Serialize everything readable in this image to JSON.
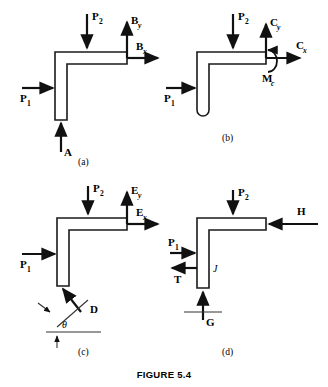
{
  "figure": {
    "caption": "FIGURE 5.4",
    "panels": [
      {
        "id": "a",
        "caption": "(a)",
        "description": "L-shaped bracket with pin reaction components at B and support force A",
        "forces": [
          {
            "name": "P1",
            "base": "P",
            "sub": "1",
            "direction": "right",
            "sub_italic": false
          },
          {
            "name": "P2",
            "base": "P",
            "sub": "2",
            "direction": "down",
            "sub_italic": false
          },
          {
            "name": "By",
            "base": "B",
            "sub": "y",
            "direction": "up",
            "sub_italic": true
          },
          {
            "name": "Bx",
            "base": "B",
            "sub": "x",
            "direction": "right",
            "sub_italic": true
          },
          {
            "name": "A",
            "base": "A",
            "sub": "",
            "direction": "up",
            "sub_italic": false
          }
        ]
      },
      {
        "id": "b",
        "caption": "(b)",
        "description": "Bracket with rounded hook end, fixed-end reactions Cx, Cy and couple Mc",
        "forces": [
          {
            "name": "P1",
            "base": "P",
            "sub": "1",
            "direction": "right",
            "sub_italic": false
          },
          {
            "name": "P2",
            "base": "P",
            "sub": "2",
            "direction": "down",
            "sub_italic": false
          },
          {
            "name": "Cy",
            "base": "C",
            "sub": "y",
            "direction": "up",
            "sub_italic": true
          },
          {
            "name": "Cx",
            "base": "C",
            "sub": "x",
            "direction": "right",
            "sub_italic": true
          },
          {
            "name": "Mc",
            "base": "M",
            "sub": "c",
            "direction": "moment",
            "sub_italic": true
          }
        ]
      },
      {
        "id": "c",
        "caption": "(c)",
        "description": "Bracket with reaction components Ex, Ey and inclined two-force member D at angle theta",
        "angle_label": "θ",
        "forces": [
          {
            "name": "P1",
            "base": "P",
            "sub": "1",
            "direction": "right",
            "sub_italic": false
          },
          {
            "name": "P2",
            "base": "P",
            "sub": "2",
            "direction": "down",
            "sub_italic": false
          },
          {
            "name": "Ey",
            "base": "E",
            "sub": "y",
            "direction": "up",
            "sub_italic": true
          },
          {
            "name": "Ex",
            "base": "E",
            "sub": "x",
            "direction": "right",
            "sub_italic": true
          },
          {
            "name": "D",
            "base": "D",
            "sub": "",
            "direction": "inclined",
            "sub_italic": false
          }
        ]
      },
      {
        "id": "d",
        "caption": "(d)",
        "description": "Bracket loaded by H, T and roller support G, member labelled J",
        "member_tag": "J",
        "forces": [
          {
            "name": "P1",
            "base": "P",
            "sub": "1",
            "direction": "right",
            "sub_italic": false
          },
          {
            "name": "P2",
            "base": "P",
            "sub": "2",
            "direction": "down",
            "sub_italic": false
          },
          {
            "name": "H",
            "base": "H",
            "sub": "",
            "direction": "left",
            "sub_italic": false
          },
          {
            "name": "T",
            "base": "T",
            "sub": "",
            "direction": "left",
            "sub_italic": false
          },
          {
            "name": "G",
            "base": "G",
            "sub": "",
            "direction": "up",
            "sub_italic": false
          }
        ]
      }
    ]
  },
  "colors": {
    "ink": "#111111",
    "outline": "#1a1a1a",
    "paper": "#ffffff"
  }
}
